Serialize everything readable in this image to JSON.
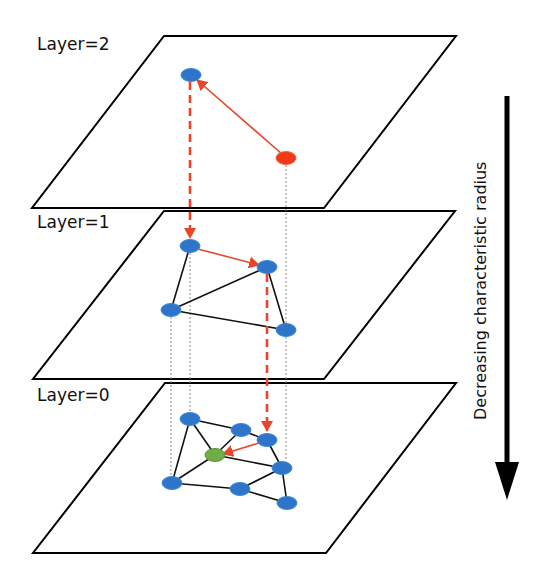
{
  "layers": [
    {
      "label": "Layer=2",
      "label_pos": [
        37,
        34
      ],
      "plane": [
        [
          164,
          36
        ],
        [
          456,
          36
        ],
        [
          324,
          208
        ],
        [
          32,
          208
        ]
      ],
      "nodes": [
        {
          "id": "L2-entry",
          "x": 191,
          "y": 75,
          "color": "blue"
        },
        {
          "id": "L2-query",
          "x": 286,
          "y": 158,
          "color": "red"
        }
      ],
      "edges": [],
      "search_arrows": [
        {
          "from": [
            282,
            154
          ],
          "to": [
            197,
            80
          ]
        }
      ]
    },
    {
      "label": "Layer=1",
      "label_pos": [
        37,
        212
      ],
      "plane": [
        [
          164,
          211
        ],
        [
          455,
          211
        ],
        [
          324,
          379
        ],
        [
          33,
          379
        ]
      ],
      "nodes": [
        {
          "id": "L1-a",
          "x": 190,
          "y": 246,
          "color": "blue"
        },
        {
          "id": "L1-b",
          "x": 267,
          "y": 267,
          "color": "blue"
        },
        {
          "id": "L1-c",
          "x": 171,
          "y": 310,
          "color": "blue"
        },
        {
          "id": "L1-d",
          "x": 286,
          "y": 330,
          "color": "blue"
        }
      ],
      "edges": [
        [
          "L1-a",
          "L1-c"
        ],
        [
          "L1-c",
          "L1-b"
        ],
        [
          "L1-c",
          "L1-d"
        ],
        [
          "L1-b",
          "L1-d"
        ]
      ],
      "search_arrows": [
        {
          "from": [
            198,
            249
          ],
          "to": [
            259,
            265
          ]
        }
      ]
    },
    {
      "label": "Layer=0",
      "label_pos": [
        37,
        385
      ],
      "plane": [
        [
          165,
          383
        ],
        [
          456,
          383
        ],
        [
          326,
          553
        ],
        [
          33,
          553
        ]
      ],
      "nodes": [
        {
          "id": "L0-a",
          "x": 190,
          "y": 419,
          "color": "blue"
        },
        {
          "id": "L0-b",
          "x": 241,
          "y": 430,
          "color": "blue"
        },
        {
          "id": "L0-c",
          "x": 267,
          "y": 440,
          "color": "blue"
        },
        {
          "id": "L0-target",
          "x": 215,
          "y": 455,
          "color": "green"
        },
        {
          "id": "L0-d",
          "x": 282,
          "y": 468,
          "color": "blue"
        },
        {
          "id": "L0-e",
          "x": 172,
          "y": 483,
          "color": "blue"
        },
        {
          "id": "L0-f",
          "x": 240,
          "y": 489,
          "color": "blue"
        },
        {
          "id": "L0-g",
          "x": 287,
          "y": 503,
          "color": "blue"
        }
      ],
      "edges": [
        [
          "L0-a",
          "L0-b"
        ],
        [
          "L0-b",
          "L0-c"
        ],
        [
          "L0-a",
          "L0-target"
        ],
        [
          "L0-a",
          "L0-e"
        ],
        [
          "L0-b",
          "L0-target"
        ],
        [
          "L0-c",
          "L0-d"
        ],
        [
          "L0-target",
          "L0-d"
        ],
        [
          "L0-target",
          "L0-e"
        ],
        [
          "L0-e",
          "L0-f"
        ],
        [
          "L0-f",
          "L0-d"
        ],
        [
          "L0-f",
          "L0-g"
        ],
        [
          "L0-d",
          "L0-g"
        ]
      ],
      "search_arrows": [
        {
          "from": [
            259,
            443
          ],
          "to": [
            223,
            454
          ]
        }
      ]
    }
  ],
  "descent_links": [
    {
      "x": 190,
      "y1": 82,
      "y2": 238
    },
    {
      "x": 267,
      "y1": 274,
      "y2": 431
    }
  ],
  "guide_lines": [
    {
      "x": 286,
      "y1": 165,
      "y2": 323
    },
    {
      "x": 190,
      "y1": 253,
      "y2": 412
    },
    {
      "x": 171,
      "y1": 317,
      "y2": 476
    },
    {
      "x": 286,
      "y1": 337,
      "y2": 461
    }
  ],
  "axis": {
    "label": "Decreasing characteristic radius",
    "x": 507,
    "y_top": 96,
    "y_bottom": 500
  },
  "colors": {
    "node_blue": "#2E75C9",
    "node_blue_stroke": "#3A8AD6",
    "node_red": "#F03A17",
    "node_green": "#70AD47",
    "node_green_stroke": "#4E9A3A",
    "search_arrow": "#E8452A",
    "descent_dash": "#E8452A",
    "plane_stroke": "#000000",
    "edge": "#111111",
    "guide": "#888888"
  }
}
